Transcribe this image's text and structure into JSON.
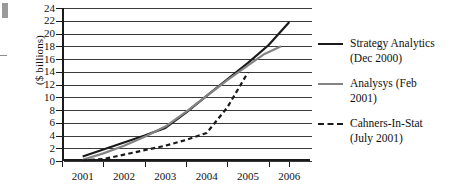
{
  "chart_data": {
    "type": "line",
    "title": "",
    "xlabel": "",
    "ylabel": "($ billions)",
    "xlim": [
      2000.5,
      2006.5
    ],
    "ylim": [
      0,
      24
    ],
    "ytick_step": 2,
    "grid": "horizontal",
    "legend_position": "right",
    "categories": [
      "2001",
      "2002",
      "2003",
      "2004",
      "2005",
      "2006"
    ],
    "yticks": [
      "24",
      "22",
      "20",
      "18",
      "16",
      "14",
      "12",
      "10",
      "8",
      "6",
      "4",
      "2",
      "0"
    ],
    "xticks": [
      "2001",
      "2002",
      "2003",
      "2004",
      "2005",
      "2006"
    ],
    "series": [
      {
        "name": "Strategy Analytics (Dec 2000)",
        "style": "solid",
        "color": "#1a1a1a",
        "x": [
          2001.0,
          2001.5,
          2002.0,
          2002.5,
          2003.0,
          2003.5,
          2004.0,
          2004.5,
          2005.0,
          2005.5,
          2006.0
        ],
        "values": [
          0.7,
          1.8,
          2.9,
          4.0,
          5.2,
          7.6,
          10.2,
          12.8,
          15.4,
          18.2,
          21.8
        ]
      },
      {
        "name": "Analysys (Feb 2001)",
        "style": "solid",
        "color": "#848484",
        "x": [
          2001.0,
          2001.5,
          2002.0,
          2002.5,
          2003.0,
          2003.5,
          2004.0,
          2004.5,
          2005.0,
          2005.4,
          2005.8
        ],
        "values": [
          0.2,
          1.2,
          2.4,
          3.8,
          5.4,
          7.7,
          10.2,
          12.7,
          15.0,
          16.8,
          18.0
        ]
      },
      {
        "name": "Cahners-In-Stat (July 2001)",
        "style": "dashed",
        "color": "#1a1a1a",
        "x": [
          2001.0,
          2001.5,
          2002.0,
          2002.5,
          2003.0,
          2003.5,
          2004.0,
          2004.5,
          2005.0
        ],
        "values": [
          0.1,
          0.3,
          1.0,
          1.7,
          2.4,
          3.3,
          4.4,
          8.4,
          13.9
        ]
      }
    ],
    "legend": [
      {
        "label_lines": [
          "Strategy Analytics",
          "(Dec 2000)"
        ],
        "style": "solid",
        "color": "#1a1a1a"
      },
      {
        "label_lines": [
          "Analysys (Feb",
          "2001)"
        ],
        "style": "solid",
        "color": "#848484"
      },
      {
        "label_lines": [
          "Cahners-In-Stat",
          "(July 2001)"
        ],
        "style": "dashed",
        "color": "#1a1a1a"
      }
    ]
  }
}
